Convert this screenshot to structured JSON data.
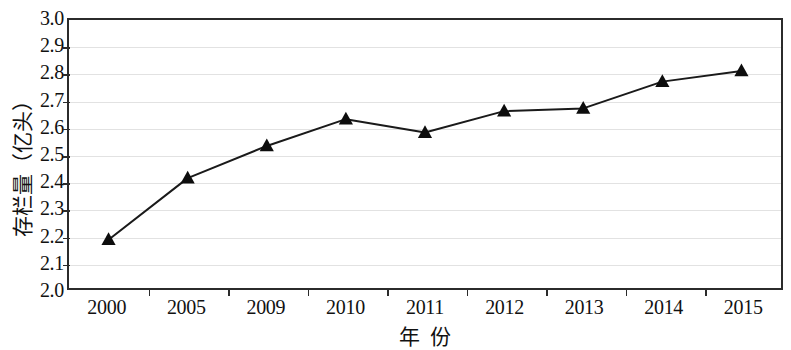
{
  "chart_data": {
    "type": "line",
    "title": "",
    "subtitle": "",
    "xlabel": "年  份",
    "ylabel": "存栏量（亿头）",
    "categories": [
      "2000",
      "2005",
      "2009",
      "2010",
      "2011",
      "2012",
      "2013",
      "2014",
      "2015"
    ],
    "values": [
      2.18,
      2.41,
      2.53,
      2.63,
      2.58,
      2.66,
      2.67,
      2.77,
      2.81
    ],
    "series": [
      {
        "name": "存栏量",
        "values": [
          2.18,
          2.41,
          2.53,
          2.63,
          2.58,
          2.66,
          2.67,
          2.77,
          2.81
        ]
      }
    ],
    "ylim": [
      2.0,
      3.0
    ],
    "ytick_labels": [
      "3.0",
      "2.9",
      "2.8",
      "2.7",
      "2.6",
      "2.5",
      "2.4",
      "2.3",
      "2.2",
      "2.1",
      "2.0"
    ],
    "ytick_values": [
      3.0,
      2.9,
      2.8,
      2.7,
      2.6,
      2.5,
      2.4,
      2.3,
      2.2,
      2.1,
      2.0
    ],
    "ytick_step": 0.1,
    "grid": true,
    "grid_axis": "y",
    "legend": false,
    "legend_position": "none",
    "marker": "triangle",
    "line_color": "#1a1a1a",
    "marker_color": "#0d0d0d",
    "grid_color": "#e2e2e2",
    "axis_color": "#2b2b2b",
    "background": "#ffffff",
    "annotations": []
  }
}
